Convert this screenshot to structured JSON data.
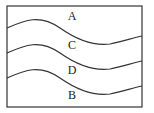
{
  "diagram": {
    "type": "layered-wavy-regions",
    "border_color": "#333333",
    "line_color": "#333333",
    "regions": [
      {
        "label": "A",
        "x": 72,
        "y": 16
      },
      {
        "label": "C",
        "x": 72,
        "y": 45
      },
      {
        "label": "D",
        "x": 72,
        "y": 70
      },
      {
        "label": "B",
        "x": 72,
        "y": 95
      }
    ],
    "curves": [
      {
        "name": "boundary-a-c",
        "d": "M7,28 C25,20 40,14 60,28 C80,42 95,46 110,44 C122,42 132,38 142,36"
      },
      {
        "name": "boundary-c-d",
        "d": "M7,53 C25,45 40,39 60,53 C80,67 95,71 110,69 C122,67 132,63 142,61"
      },
      {
        "name": "boundary-d-b",
        "d": "M7,78 C25,70 40,64 60,78 C80,92 95,96 110,94 C122,92 132,88 142,86"
      }
    ]
  }
}
